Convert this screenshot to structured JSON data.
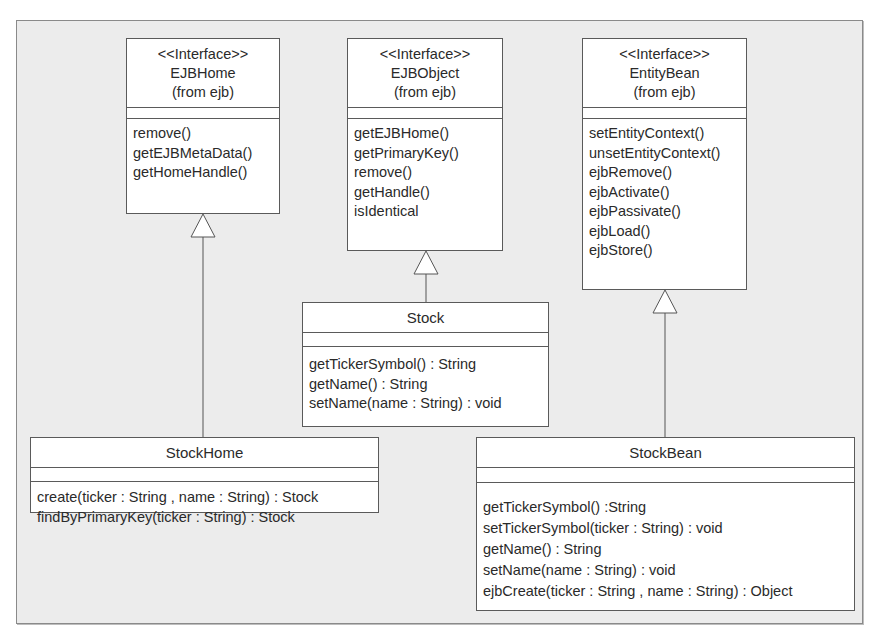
{
  "diagram": {
    "type": "UML class diagram",
    "classes": {
      "ejbhome": {
        "stereotype": "<<Interface>>",
        "name": "EJBHome",
        "package": "(from ejb)",
        "operations": [
          "remove()",
          "getEJBMetaData()",
          "getHomeHandle()"
        ]
      },
      "ejbobject": {
        "stereotype": "<<Interface>>",
        "name": "EJBObject",
        "package": "(from ejb)",
        "operations": [
          "getEJBHome()",
          "getPrimaryKey()",
          "remove()",
          "getHandle()",
          "isIdentical"
        ]
      },
      "entitybean": {
        "stereotype": "<<Interface>>",
        "name": "EntityBean",
        "package": "(from ejb)",
        "operations": [
          "setEntityContext()",
          "unsetEntityContext()",
          "ejbRemove()",
          "ejbActivate()",
          "ejbPassivate()",
          "ejbLoad()",
          "ejbStore()"
        ]
      },
      "stock": {
        "name": "Stock",
        "operations": [
          "getTickerSymbol() : String",
          "getName() : String",
          "setName(name : String) : void"
        ]
      },
      "stockhome": {
        "name": "StockHome",
        "operations": [
          "create(ticker : String , name : String) : Stock",
          "findByPrimaryKey(ticker : String) : Stock"
        ]
      },
      "stockbean": {
        "name": "StockBean",
        "operations": [
          "getTickerSymbol() :String",
          "setTickerSymbol(ticker : String) : void",
          "getName() : String",
          "setName(name : String) : void",
          "ejbCreate(ticker : String , name : String) : Object"
        ]
      }
    },
    "relationships": [
      {
        "type": "generalization",
        "from": "StockHome",
        "to": "EJBHome"
      },
      {
        "type": "generalization",
        "from": "Stock",
        "to": "EJBObject"
      },
      {
        "type": "generalization",
        "from": "StockBean",
        "to": "EntityBean"
      }
    ]
  }
}
